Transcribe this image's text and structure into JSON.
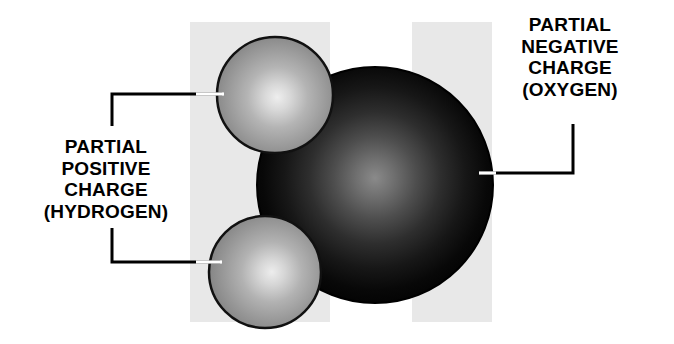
{
  "diagram": {
    "background_color": "#ffffff",
    "panel_color": "#e8e8e8",
    "oxygen_color": "#000000",
    "oxygen_highlight_color": "#6e6e6e",
    "hydrogen_color": "#8f8f8f",
    "hydrogen_highlight_color": "#e2e2e2",
    "outline_color": "#1a1a1a",
    "leader_color": "#000000",
    "leader_tip_color": "#ffffff"
  },
  "labels": {
    "positive": {
      "name": "partial-positive-charge-label",
      "lines": [
        "PARTIAL",
        "POSITIVE",
        "CHARGE",
        "(HYDROGEN)"
      ],
      "line1": "PARTIAL",
      "line2": "POSITIVE",
      "line3": "CHARGE",
      "line4": "(HYDROGEN)"
    },
    "negative": {
      "name": "partial-negative-charge-label",
      "lines": [
        "PARTIAL",
        "NEGATIVE",
        "CHARGE",
        "(OXYGEN)"
      ],
      "line1": "PARTIAL",
      "line2": "NEGATIVE",
      "line3": "CHARGE",
      "line4": "(OXYGEN)"
    }
  },
  "atoms": {
    "oxygen": {
      "element": "oxygen",
      "charge": "partial negative",
      "cx": 375,
      "cy": 185,
      "r": 118
    },
    "hydrogen_top": {
      "element": "hydrogen",
      "charge": "partial positive",
      "cx": 275,
      "cy": 95,
      "r": 58
    },
    "hydrogen_bottom": {
      "element": "hydrogen",
      "charge": "partial positive",
      "cx": 265,
      "cy": 272,
      "r": 56
    }
  },
  "panels": {
    "left": {
      "x": 190,
      "y": 22,
      "width": 140,
      "height": 300
    },
    "right": {
      "x": 412,
      "y": 22,
      "width": 80,
      "height": 300
    }
  },
  "leaders": {
    "hydrogen_top": {
      "path": "M 112,126 L 112,94 L 222,94"
    },
    "hydrogen_bottom": {
      "path": "M 112,228 L 112,262 L 220,262"
    },
    "oxygen": {
      "path": "M 573,124 L 573,173 L 481,173"
    }
  }
}
